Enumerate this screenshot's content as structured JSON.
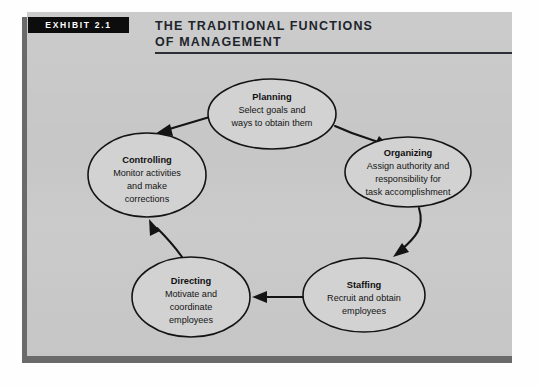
{
  "exhibit": {
    "tab_label": "EXHIBIT 2.1",
    "title_line_1": "THE TRADITIONAL FUNCTIONS",
    "title_line_2": "OF MANAGEMENT"
  },
  "colors": {
    "panel_background": "#c9c9c9",
    "panel_shadow": "#6a6a6a",
    "tab_background": "#0d0d0d",
    "tab_text": "#ffffff",
    "ellipse_fill": "#d2d2d2",
    "stroke": "#141414",
    "page_background": "#fefefe"
  },
  "diagram": {
    "type": "cycle",
    "node_count": 5,
    "nodes": [
      {
        "id": "planning",
        "title": "Planning",
        "lines": [
          "Select goals and",
          "ways to obtain them"
        ],
        "cx": 245,
        "cy": 102,
        "rx": 64,
        "ry": 35
      },
      {
        "id": "organizing",
        "title": "Organizing",
        "lines": [
          "Assign authority and",
          "responsibility for",
          "task accomplishment"
        ],
        "cx": 381,
        "cy": 160,
        "rx": 63,
        "ry": 35
      },
      {
        "id": "staffing",
        "title": "Staffing",
        "lines": [
          "Recruit and obtain",
          "employees"
        ],
        "cx": 337,
        "cy": 283,
        "rx": 61,
        "ry": 37
      },
      {
        "id": "directing",
        "title": "Directing",
        "lines": [
          "Motivate and",
          "coordinate",
          "employees"
        ],
        "cx": 164,
        "cy": 285,
        "rx": 59,
        "ry": 40
      },
      {
        "id": "controlling",
        "title": "Controlling",
        "lines": [
          "Monitor activities",
          "and make",
          "corrections"
        ],
        "cx": 120,
        "cy": 163,
        "rx": 59,
        "ry": 42
      }
    ],
    "edges": [
      {
        "from": "planning",
        "to": "organizing",
        "style": "curved"
      },
      {
        "from": "organizing",
        "to": "staffing",
        "style": "curved"
      },
      {
        "from": "staffing",
        "to": "directing",
        "style": "straight"
      },
      {
        "from": "directing",
        "to": "controlling",
        "style": "curved"
      },
      {
        "from": "controlling",
        "to": "planning",
        "style": "curved-reverse"
      }
    ]
  }
}
